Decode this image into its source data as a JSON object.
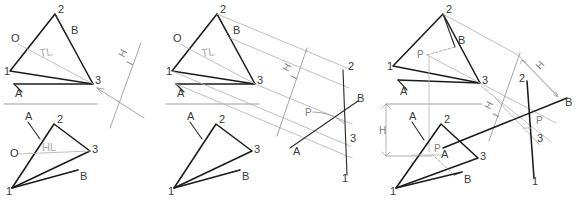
{
  "figure": {
    "background_color": "#ffffff",
    "ink_color": "#1b1b1b",
    "construction_color": "#b4b4b4",
    "reference_line_color": "#9d9d9d"
  },
  "panels": [
    {
      "id": "panel-1",
      "name": "step-1-true-length",
      "views": {
        "top": {
          "name": "horizontal-view",
          "vertices": [
            {
              "label": "2",
              "x": 55,
              "y": 14
            },
            {
              "label": "1",
              "x": 10,
              "y": 71
            },
            {
              "label": "3",
              "x": 93,
              "y": 84
            }
          ],
          "line_labels": [
            {
              "label": "A",
              "x": 18,
              "y": 95
            },
            {
              "label": "B",
              "x": 73,
              "y": 32
            },
            {
              "label": "O",
              "x": 14,
              "y": 39
            }
          ],
          "annotation": {
            "label": "TL",
            "x": 46,
            "y": 57
          }
        },
        "front": {
          "name": "frontal-view",
          "vertices": [
            {
              "label": "2",
              "x": 54,
              "y": 124
            },
            {
              "label": "1",
              "x": 12,
              "y": 188
            },
            {
              "label": "3",
              "x": 90,
              "y": 151
            }
          ],
          "line_labels": [
            {
              "label": "A",
              "x": 23,
              "y": 119
            },
            {
              "label": "B",
              "x": 78,
              "y": 176
            },
            {
              "label": "O",
              "x": 14,
              "y": 154
            }
          ],
          "annotation": {
            "label": "HL",
            "x": 48,
            "y": 150
          }
        }
      },
      "fold_line": {
        "label_h": "H",
        "label_i": "I"
      },
      "reference_line": {
        "x1": 4,
        "y1": 104,
        "x2": 97,
        "y2": 104
      }
    },
    {
      "id": "panel-2",
      "name": "step-2-auxiliary-edge-view",
      "views": {
        "top": {
          "name": "horizontal-view",
          "vertices": [
            {
              "label": "2",
              "x": 217,
              "y": 14
            },
            {
              "label": "1",
              "x": 172,
              "y": 71
            },
            {
              "label": "3",
              "x": 255,
              "y": 84
            }
          ],
          "line_labels": [
            {
              "label": "A",
              "x": 180,
              "y": 95
            },
            {
              "label": "B",
              "x": 235,
              "y": 32
            },
            {
              "label": "O",
              "x": 176,
              "y": 39
            }
          ],
          "annotation": {
            "label": "TL",
            "x": 208,
            "y": 57
          }
        },
        "front": {
          "name": "frontal-view",
          "vertices": [
            {
              "label": "2",
              "x": 216,
              "y": 124
            },
            {
              "label": "1",
              "x": 174,
              "y": 188
            },
            {
              "label": "3",
              "x": 252,
              "y": 151
            }
          ],
          "line_labels": [
            {
              "label": "B",
              "x": 240,
              "y": 176
            },
            {
              "label": "A",
              "x": 185,
              "y": 119
            }
          ]
        },
        "auxiliary": {
          "name": "auxiliary-edge-view",
          "vertices": [
            {
              "label": "2",
              "x": 345,
              "y": 70
            },
            {
              "label": "3",
              "x": 345,
              "y": 139
            },
            {
              "label": "1",
              "x": 344,
              "y": 175
            }
          ],
          "line_labels": [
            {
              "label": "B",
              "x": 354,
              "y": 103
            },
            {
              "label": "A",
              "x": 297,
              "y": 147
            }
          ],
          "piercing_point": {
            "label": "P",
            "x": 315,
            "y": 112
          }
        }
      },
      "fold_line": {
        "label_h": "H",
        "label_i": "I"
      },
      "reference_line": {
        "x1": 166,
        "y1": 104,
        "x2": 259,
        "y2": 104
      }
    },
    {
      "id": "panel-3",
      "name": "step-3-project-piercing-point-back",
      "views": {
        "top": {
          "name": "horizontal-view",
          "vertices": [
            {
              "label": "2",
              "x": 443,
              "y": 14
            },
            {
              "label": "1",
              "x": 393,
              "y": 66
            },
            {
              "label": "3",
              "x": 480,
              "y": 83
            }
          ],
          "line_labels": [
            {
              "label": "A",
              "x": 403,
              "y": 93
            },
            {
              "label": "B",
              "x": 458,
              "y": 42
            }
          ],
          "piercing_point": {
            "label": "P",
            "x": 423,
            "y": 58
          }
        },
        "front": {
          "name": "frontal-view",
          "vertices": [
            {
              "label": "2",
              "x": 441,
              "y": 124
            },
            {
              "label": "1",
              "x": 396,
              "y": 188
            },
            {
              "label": "3",
              "x": 478,
              "y": 158
            }
          ],
          "line_labels": [
            {
              "label": "A",
              "x": 412,
              "y": 119
            },
            {
              "label": "B",
              "x": 462,
              "y": 180
            }
          ],
          "piercing_point": {
            "label": "P",
            "x": 443,
            "y": 152
          }
        },
        "auxiliary": {
          "name": "auxiliary-edge-view",
          "vertices": [
            {
              "label": "2",
              "x": 528,
              "y": 80
            },
            {
              "label": "3",
              "x": 541,
              "y": 138
            },
            {
              "label": "1",
              "x": 537,
              "y": 177
            }
          ],
          "line_labels": [
            {
              "label": "B",
              "x": 563,
              "y": 105
            },
            {
              "label": "A",
              "x": 446,
              "y": 148
            }
          ],
          "piercing_point": {
            "label": "P",
            "x": 540,
            "y": 125
          }
        }
      },
      "fold_line": {
        "label_h": "H",
        "label_i": "I"
      },
      "reference_line": {
        "x1": 386,
        "y1": 104,
        "x2": 482,
        "y2": 104
      },
      "dimensions": [
        {
          "label": "H",
          "name": "height-left",
          "x": 390,
          "y": 138
        },
        {
          "label": "H",
          "name": "height-auxiliary",
          "x": 545,
          "y": 67
        }
      ]
    }
  ],
  "legend": {
    "true_length": "TL",
    "horizontal_line": "HL",
    "piercing_point": "P",
    "fold_horizontal": "H",
    "fold_auxiliary": "I",
    "height_dimension": "H",
    "vertex_1": "1",
    "vertex_2": "2",
    "vertex_3": "3",
    "line_end_a": "A",
    "line_end_b": "B",
    "point_o": "O"
  }
}
